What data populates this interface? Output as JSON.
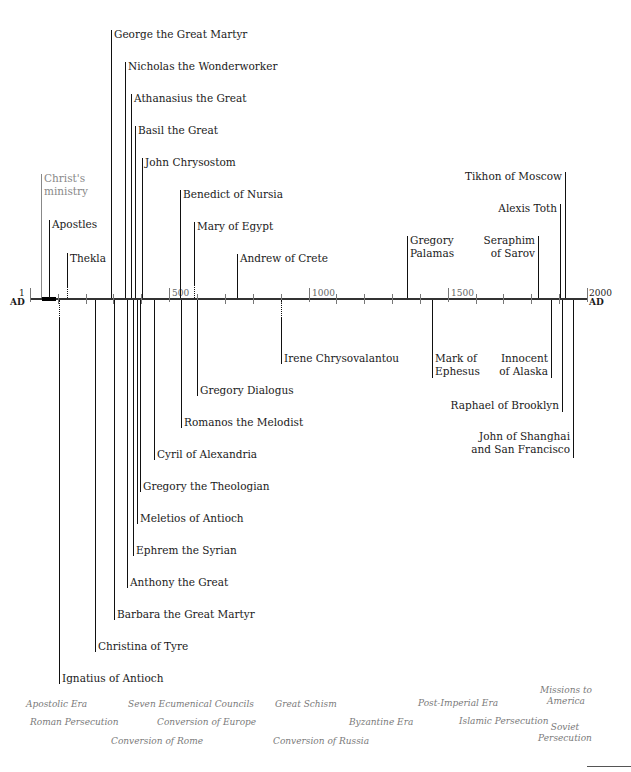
{
  "axis": {
    "start_label": "1",
    "start_unit": "AD",
    "end_label": "2000",
    "end_unit": "AD",
    "ticks": [
      "500",
      "1000",
      "1500"
    ]
  },
  "above": {
    "christs_ministry": "Christ's ministry",
    "christs_ministry_l1": "Christ's",
    "christs_ministry_l2": "ministry",
    "apostles": "Apostles",
    "thekla": "Thekla",
    "george": "George the Great Martyr",
    "nicholas": "Nicholas the Wonderworker",
    "athanasius": "Athanasius the Great",
    "basil": "Basil the Great",
    "john_chrysostom": "John Chrysostom",
    "benedict": "Benedict of Nursia",
    "mary": "Mary of Egypt",
    "andrew": "Andrew of Crete",
    "gregory_palamas_l1": "Gregory",
    "gregory_palamas_l2": "Palamas",
    "seraphim_l1": "Seraphim",
    "seraphim_l2": "of Sarov",
    "alexis": "Alexis Toth",
    "tikhon": "Tikhon of Moscow"
  },
  "below": {
    "ignatius": "Ignatius of Antioch",
    "christina": "Christina of Tyre",
    "barbara": "Barbara the Great Martyr",
    "anthony": "Anthony the Great",
    "ephrem": "Ephrem the Syrian",
    "meletios": "Meletios of Antioch",
    "gregory_theologian": "Gregory the Theologian",
    "cyril": "Cyril of Alexandria",
    "romanos": "Romanos the Melodist",
    "gregory_dialogus": "Gregory Dialogus",
    "irene": "Irene Chrysovalantou",
    "mark_l1": "Mark of",
    "mark_l2": "Ephesus",
    "innocent_l1": "Innocent",
    "innocent_l2": "of Alaska",
    "raphael": "Raphael of Brooklyn",
    "john_shanghai_l1": "John of Shanghai",
    "john_shanghai_l2": "and San Francisco"
  },
  "eras": {
    "apostolic": "Apostolic Era",
    "roman_persecution": "Roman Persecution",
    "conversion_rome": "Conversion of Rome",
    "seven_councils": "Seven Ecumenical Councils",
    "conversion_europe": "Conversion of Europe",
    "great_schism": "Great Schism",
    "conversion_russia": "Conversion of Russia",
    "byzantine": "Byzantine Era",
    "post_imperial": "Post-Imperial Era",
    "islamic_persecution": "Islamic Persecution",
    "missions_l1": "Missions to",
    "missions_l2": "America",
    "soviet_l1": "Soviet",
    "soviet_l2": "Persecution"
  }
}
